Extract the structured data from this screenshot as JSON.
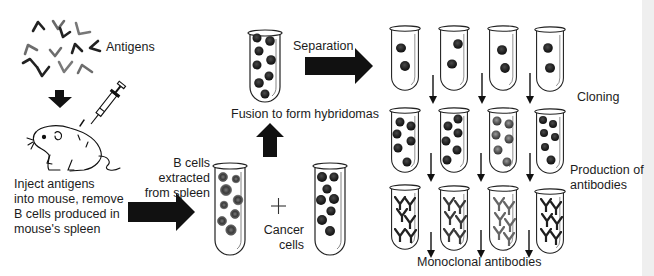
{
  "labels": {
    "antigens": "Antigens",
    "inject": [
      "Inject antigens",
      "into mouse, remove",
      "B  cells produced in",
      "mouse's spleen"
    ],
    "b_cells": [
      "B cells",
      "extracted",
      "from spleen"
    ],
    "plus": "+",
    "cancer_cells": [
      "Cancer",
      "cells"
    ],
    "fusion": "Fusion to form hybridomas",
    "separation": "Separation",
    "cloning": "Cloning",
    "production": [
      "Production of",
      "antibodies"
    ],
    "monoclonal": "Monoclonal antibodies"
  },
  "colors": {
    "ink": "#111111",
    "cell_dark": "#1e1e1e",
    "cell_gray": "#555555",
    "antigen_dark": "#222222",
    "antigen_gray": "#7a7a7a",
    "background": "#ffffff"
  },
  "icons": {
    "antigen": "chevron-antigen-icon",
    "syringe": "syringe-icon",
    "mouse": "mouse-icon",
    "test_tube": "test-tube-icon",
    "antibody": "y-antibody-icon",
    "block_arrow": "block-arrow-icon",
    "thin_arrow": "down-arrow-icon"
  },
  "steps": [
    {
      "id": 1,
      "label": "Inject antigens into mouse, remove B cells produced in mouse's spleen"
    },
    {
      "id": 2,
      "label": "B cells extracted from spleen"
    },
    {
      "id": 3,
      "label": "Cancer cells"
    },
    {
      "id": 4,
      "label": "Fusion to form hybridomas"
    },
    {
      "id": 5,
      "label": "Separation"
    },
    {
      "id": 6,
      "label": "Cloning"
    },
    {
      "id": 7,
      "label": "Production of antibodies"
    },
    {
      "id": 8,
      "label": "Monoclonal antibodies"
    }
  ],
  "grid": {
    "columns": 4,
    "rows": [
      "separated",
      "cloned",
      "antibodies"
    ]
  }
}
